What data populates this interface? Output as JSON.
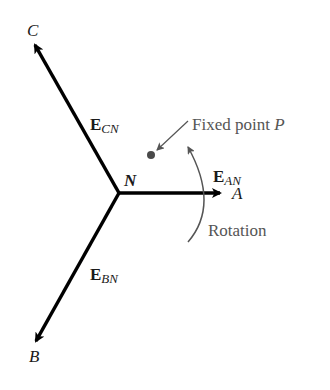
{
  "diagram": {
    "node_center": {
      "label": "N",
      "x": 119,
      "y": 193
    },
    "vectors": [
      {
        "id": "A",
        "end_label": "A",
        "vector_label": "E",
        "subscript": "AN",
        "x2": 218,
        "y2": 193
      },
      {
        "id": "B",
        "end_label": "B",
        "vector_label": "E",
        "subscript": "BN",
        "x2": 36,
        "y2": 340
      },
      {
        "id": "C",
        "end_label": "C",
        "vector_label": "E",
        "subscript": "CN",
        "x2": 35,
        "y2": 46
      }
    ],
    "fixed_point": {
      "label_prefix": "Fixed point ",
      "label_var": "P",
      "x": 151,
      "y": 154
    },
    "rotation": {
      "label": "Rotation"
    },
    "colors": {
      "vector": "#000000",
      "annotation": "#555555",
      "point": "#4a4a4a"
    }
  }
}
